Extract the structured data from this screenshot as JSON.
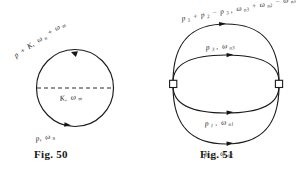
{
  "plate": {
    "background_color": "#ffffff",
    "ink_color": "#1b1b1b",
    "width": 303,
    "height": 172
  },
  "figures": [
    {
      "id": "fig-50",
      "caption": "Fig. 50",
      "shape": "circle",
      "description": "single closed fermion loop with a dashed interaction line across the middle",
      "labels": {
        "top": {
          "text": "p + K,  ωₙ + ωₘ",
          "parts": [
            {
              "base": "p",
              "sub": ""
            },
            {
              "base": "+",
              "sub": ""
            },
            {
              "base": "K,",
              "sub": ""
            },
            {
              "base": "ω",
              "sub": "n"
            },
            {
              "base": "+",
              "sub": ""
            },
            {
              "base": "ω",
              "sub": "m"
            }
          ]
        },
        "middle": {
          "text": "K,  ωₘ",
          "parts": [
            {
              "base": "K,",
              "sub": ""
            },
            {
              "base": "ω",
              "sub": "m"
            }
          ]
        },
        "bottom": {
          "text": "p,  ωₙ",
          "parts": [
            {
              "base": "p,",
              "sub": ""
            },
            {
              "base": "ω",
              "sub": "n"
            }
          ]
        }
      }
    },
    {
      "id": "fig-51",
      "caption": "Fig. 51",
      "shape": "double-loop",
      "description": "two overlapping closed loops joined at two square vertices, four directed arcs",
      "labels": {
        "outer_top": {
          "text": "p₁ + p₂ − p₃,  ωₙ₁ + ωₙ₂ − ωₙ₃",
          "parts": [
            {
              "base": "p",
              "sub": "1"
            },
            {
              "base": "+",
              "sub": ""
            },
            {
              "base": "p",
              "sub": "2"
            },
            {
              "base": "−",
              "sub": ""
            },
            {
              "base": "p",
              "sub": "3"
            },
            {
              "base": ",",
              "sub": ""
            },
            {
              "base": "ω",
              "sub": "n3"
            },
            {
              "base": "+",
              "sub": ""
            },
            {
              "base": "ω",
              "sub": "n2"
            },
            {
              "base": "−",
              "sub": ""
            },
            {
              "base": "ω",
              "sub": "n3"
            }
          ]
        },
        "inner_upper": {
          "text": "p₃,  ωₙ₃",
          "parts": [
            {
              "base": "p",
              "sub": "3"
            },
            {
              "base": ",",
              "sub": ""
            },
            {
              "base": "ω",
              "sub": "n3"
            }
          ]
        },
        "inner_lower": {
          "text": "p₁,  ωₙ₁",
          "parts": [
            {
              "base": "p",
              "sub": "1"
            },
            {
              "base": ",",
              "sub": ""
            },
            {
              "base": "ω",
              "sub": "n1"
            }
          ]
        },
        "outer_bottom": {
          "text": "p₂,  ωₙ₂",
          "parts": [
            {
              "base": "p",
              "sub": "2"
            },
            {
              "base": ",",
              "sub": ""
            },
            {
              "base": "ω",
              "sub": "n2"
            }
          ]
        }
      }
    }
  ]
}
